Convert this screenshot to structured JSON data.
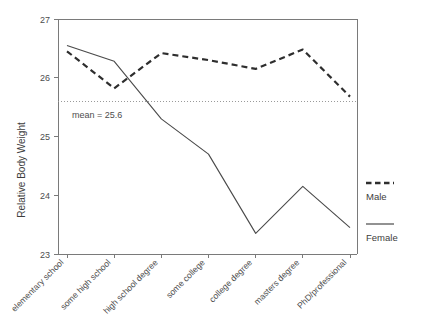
{
  "chart_data": {
    "type": "line",
    "title": "",
    "xlabel": "",
    "ylabel": "Relative Body Weight",
    "ylim": [
      23,
      27
    ],
    "yticks": [
      23,
      24,
      25,
      26,
      27
    ],
    "ytick_labels": [
      "23",
      "24",
      "25",
      "26",
      "27"
    ],
    "grid": false,
    "legend_position": "right",
    "categories": [
      "elementary school",
      "some high school",
      "high school degree",
      "some college",
      "college degree",
      "masters degree",
      "PhD/professional"
    ],
    "series": [
      {
        "name": "Male",
        "style": "dashed",
        "color": "#2e2e2e",
        "values": [
          26.45,
          25.82,
          26.42,
          26.3,
          26.15,
          26.48,
          25.68
        ]
      },
      {
        "name": "Female",
        "style": "solid",
        "color": "#4a4a4a",
        "values": [
          26.55,
          26.28,
          25.3,
          24.7,
          23.35,
          24.15,
          23.45
        ]
      }
    ],
    "annotations": [
      {
        "type": "hline",
        "value": 25.6,
        "label": "mean = 25.6",
        "style": "dotted",
        "color": "#9a9a9a"
      }
    ]
  },
  "axes": {
    "y_title": "Relative Body Weight",
    "y_ticks": [
      "27",
      "26",
      "25",
      "24",
      "23"
    ],
    "x_categories": [
      "elementary school",
      "some high school",
      "high school degree",
      "some college",
      "college degree",
      "masters degree",
      "PhD/professional"
    ]
  },
  "annotation": {
    "mean_text": "mean = 25.6"
  },
  "legend": {
    "entries": [
      {
        "label": "Male",
        "style": "dashed"
      },
      {
        "label": "Female",
        "style": "solid"
      }
    ]
  }
}
